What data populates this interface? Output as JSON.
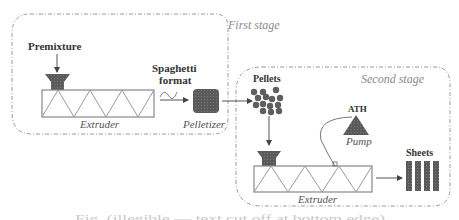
{
  "diagram": {
    "stages": {
      "first": "First stage",
      "second": "Second stage"
    },
    "labels": {
      "premixture": "Premixture",
      "spaghetti_line1": "Spaghetti",
      "spaghetti_line2": "format",
      "extruder1": "Extruder",
      "pelletizer": "Pelletizer",
      "pellets": "Pellets",
      "ath": "ATH",
      "pump": "Pump",
      "extruder2": "Extruder",
      "sheets": "Sheets"
    },
    "caption": "Fig. (illegible — text cut off at bottom edge)",
    "colors": {
      "dark_component": "#555555",
      "dashed_border": "#9a9a9a",
      "barrel_outline": "#888888"
    }
  }
}
